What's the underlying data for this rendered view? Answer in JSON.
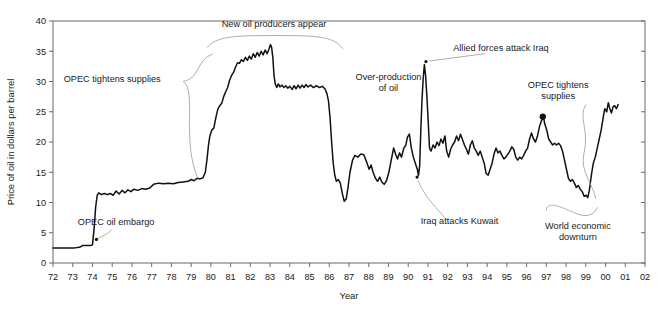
{
  "chart_data": {
    "type": "line",
    "title": "",
    "xlabel": "Year",
    "ylabel": "Price of oil in dollars per barrel",
    "xlim": [
      1972,
      2002
    ],
    "ylim": [
      0,
      40
    ],
    "grid": false,
    "legend": "none",
    "x_tick_labels": [
      "72",
      "73",
      "74",
      "75",
      "76",
      "77",
      "78",
      "79",
      "80",
      "81",
      "82",
      "83",
      "84",
      "85",
      "86",
      "87",
      "88",
      "89",
      "90",
      "91",
      "92",
      "93",
      "94",
      "95",
      "96",
      "97",
      "98",
      "99",
      "00",
      "01",
      "02"
    ],
    "y_tick_labels": [
      "0",
      "5",
      "10",
      "15",
      "20",
      "25",
      "30",
      "35",
      "40"
    ],
    "y_ticks": [
      0,
      5,
      10,
      15,
      20,
      25,
      30,
      35,
      40
    ],
    "series": [
      {
        "name": "Price of oil",
        "color": "#111111",
        "points": [
          [
            1972.0,
            2.5
          ],
          [
            1972.3,
            2.5
          ],
          [
            1972.6,
            2.5
          ],
          [
            1972.9,
            2.5
          ],
          [
            1973.1,
            2.5
          ],
          [
            1973.35,
            2.6
          ],
          [
            1973.5,
            2.9
          ],
          [
            1973.7,
            2.9
          ],
          [
            1973.9,
            2.9
          ],
          [
            1974.0,
            3.0
          ],
          [
            1974.08,
            5.6
          ],
          [
            1974.16,
            9.2
          ],
          [
            1974.24,
            11.2
          ],
          [
            1974.32,
            11.6
          ],
          [
            1974.45,
            11.3
          ],
          [
            1974.6,
            11.5
          ],
          [
            1974.75,
            11.3
          ],
          [
            1974.9,
            11.5
          ],
          [
            1975.05,
            11.2
          ],
          [
            1975.2,
            11.9
          ],
          [
            1975.35,
            11.4
          ],
          [
            1975.5,
            12.0
          ],
          [
            1975.65,
            11.6
          ],
          [
            1975.8,
            12.1
          ],
          [
            1975.95,
            11.8
          ],
          [
            1976.1,
            12.2
          ],
          [
            1976.3,
            12.0
          ],
          [
            1976.5,
            12.3
          ],
          [
            1976.7,
            12.2
          ],
          [
            1976.9,
            12.4
          ],
          [
            1977.1,
            13.0
          ],
          [
            1977.35,
            13.2
          ],
          [
            1977.6,
            13.1
          ],
          [
            1977.85,
            13.2
          ],
          [
            1978.1,
            13.1
          ],
          [
            1978.35,
            13.3
          ],
          [
            1978.6,
            13.4
          ],
          [
            1978.85,
            13.5
          ],
          [
            1979.0,
            13.8
          ],
          [
            1979.15,
            13.6
          ],
          [
            1979.3,
            14.0
          ],
          [
            1979.45,
            13.9
          ],
          [
            1979.6,
            14.1
          ],
          [
            1979.72,
            15.0
          ],
          [
            1979.8,
            17.0
          ],
          [
            1979.88,
            19.5
          ],
          [
            1979.95,
            21.0
          ],
          [
            1980.05,
            22.0
          ],
          [
            1980.15,
            22.3
          ],
          [
            1980.25,
            24.0
          ],
          [
            1980.35,
            25.4
          ],
          [
            1980.45,
            26.0
          ],
          [
            1980.55,
            26.4
          ],
          [
            1980.65,
            27.5
          ],
          [
            1980.75,
            28.3
          ],
          [
            1980.85,
            29.0
          ],
          [
            1980.95,
            30.2
          ],
          [
            1981.05,
            31.0
          ],
          [
            1981.15,
            31.5
          ],
          [
            1981.25,
            32.4
          ],
          [
            1981.35,
            33.1
          ],
          [
            1981.45,
            33.0
          ],
          [
            1981.55,
            33.6
          ],
          [
            1981.65,
            33.3
          ],
          [
            1981.75,
            34.0
          ],
          [
            1981.85,
            33.5
          ],
          [
            1981.95,
            34.2
          ],
          [
            1982.05,
            33.7
          ],
          [
            1982.15,
            34.6
          ],
          [
            1982.25,
            34.0
          ],
          [
            1982.35,
            34.8
          ],
          [
            1982.45,
            34.2
          ],
          [
            1982.55,
            35.0
          ],
          [
            1982.65,
            34.4
          ],
          [
            1982.75,
            35.2
          ],
          [
            1982.85,
            34.6
          ],
          [
            1982.95,
            35.4
          ],
          [
            1983.02,
            36.1
          ],
          [
            1983.08,
            35.6
          ],
          [
            1983.14,
            34.0
          ],
          [
            1983.2,
            31.0
          ],
          [
            1983.26,
            29.6
          ],
          [
            1983.34,
            29.0
          ],
          [
            1983.42,
            29.6
          ],
          [
            1983.5,
            29.1
          ],
          [
            1983.6,
            29.4
          ],
          [
            1983.7,
            29.0
          ],
          [
            1983.8,
            29.3
          ],
          [
            1983.9,
            28.9
          ],
          [
            1984.0,
            29.2
          ],
          [
            1984.12,
            28.7
          ],
          [
            1984.22,
            29.3
          ],
          [
            1984.32,
            28.8
          ],
          [
            1984.42,
            29.4
          ],
          [
            1984.52,
            28.9
          ],
          [
            1984.62,
            29.4
          ],
          [
            1984.72,
            29.0
          ],
          [
            1984.82,
            29.5
          ],
          [
            1984.92,
            29.1
          ],
          [
            1985.05,
            29.4
          ],
          [
            1985.2,
            29.0
          ],
          [
            1985.35,
            29.3
          ],
          [
            1985.5,
            29.0
          ],
          [
            1985.65,
            29.2
          ],
          [
            1985.78,
            28.8
          ],
          [
            1985.88,
            28.0
          ],
          [
            1985.96,
            26.8
          ],
          [
            1986.04,
            24.0
          ],
          [
            1986.12,
            20.0
          ],
          [
            1986.2,
            16.5
          ],
          [
            1986.28,
            14.5
          ],
          [
            1986.36,
            13.5
          ],
          [
            1986.46,
            13.8
          ],
          [
            1986.56,
            13.2
          ],
          [
            1986.66,
            11.5
          ],
          [
            1986.76,
            10.2
          ],
          [
            1986.86,
            10.6
          ],
          [
            1986.95,
            12.5
          ],
          [
            1987.05,
            15.0
          ],
          [
            1987.18,
            17.0
          ],
          [
            1987.3,
            17.8
          ],
          [
            1987.45,
            17.5
          ],
          [
            1987.6,
            18.0
          ],
          [
            1987.75,
            17.9
          ],
          [
            1987.88,
            16.8
          ],
          [
            1988.02,
            15.5
          ],
          [
            1988.12,
            16.2
          ],
          [
            1988.22,
            15.0
          ],
          [
            1988.34,
            14.0
          ],
          [
            1988.45,
            13.5
          ],
          [
            1988.56,
            14.2
          ],
          [
            1988.66,
            13.4
          ],
          [
            1988.78,
            13.0
          ],
          [
            1988.9,
            13.6
          ],
          [
            1989.02,
            15.0
          ],
          [
            1989.14,
            17.0
          ],
          [
            1989.26,
            19.0
          ],
          [
            1989.36,
            18.0
          ],
          [
            1989.46,
            17.2
          ],
          [
            1989.56,
            18.2
          ],
          [
            1989.66,
            17.5
          ],
          [
            1989.78,
            19.0
          ],
          [
            1989.88,
            19.5
          ],
          [
            1989.96,
            20.8
          ],
          [
            1990.06,
            21.3
          ],
          [
            1990.16,
            19.0
          ],
          [
            1990.26,
            17.5
          ],
          [
            1990.36,
            16.5
          ],
          [
            1990.46,
            15.5
          ],
          [
            1990.52,
            14.5
          ],
          [
            1990.58,
            16.0
          ],
          [
            1990.64,
            22.0
          ],
          [
            1990.7,
            27.0
          ],
          [
            1990.76,
            30.5
          ],
          [
            1990.82,
            32.8
          ],
          [
            1990.88,
            31.0
          ],
          [
            1990.94,
            28.0
          ],
          [
            1991.02,
            23.0
          ],
          [
            1991.08,
            19.0
          ],
          [
            1991.16,
            18.5
          ],
          [
            1991.26,
            19.5
          ],
          [
            1991.36,
            19.0
          ],
          [
            1991.46,
            20.0
          ],
          [
            1991.56,
            19.4
          ],
          [
            1991.66,
            20.5
          ],
          [
            1991.76,
            19.8
          ],
          [
            1991.86,
            21.0
          ],
          [
            1991.95,
            18.5
          ],
          [
            1992.05,
            17.5
          ],
          [
            1992.15,
            18.8
          ],
          [
            1992.25,
            19.5
          ],
          [
            1992.35,
            20.0
          ],
          [
            1992.45,
            21.0
          ],
          [
            1992.55,
            20.2
          ],
          [
            1992.65,
            21.3
          ],
          [
            1992.75,
            20.4
          ],
          [
            1992.85,
            19.5
          ],
          [
            1992.95,
            18.8
          ],
          [
            1993.05,
            18.0
          ],
          [
            1993.15,
            19.5
          ],
          [
            1993.25,
            20.2
          ],
          [
            1993.35,
            19.0
          ],
          [
            1993.45,
            18.5
          ],
          [
            1993.55,
            17.8
          ],
          [
            1993.65,
            18.5
          ],
          [
            1993.75,
            17.5
          ],
          [
            1993.85,
            16.5
          ],
          [
            1993.95,
            14.8
          ],
          [
            1994.05,
            14.5
          ],
          [
            1994.15,
            15.5
          ],
          [
            1994.25,
            16.5
          ],
          [
            1994.35,
            18.0
          ],
          [
            1994.45,
            19.0
          ],
          [
            1994.55,
            18.2
          ],
          [
            1994.65,
            18.5
          ],
          [
            1994.75,
            17.8
          ],
          [
            1994.85,
            17.2
          ],
          [
            1994.95,
            17.5
          ],
          [
            1995.05,
            18.0
          ],
          [
            1995.15,
            18.5
          ],
          [
            1995.25,
            19.2
          ],
          [
            1995.35,
            18.8
          ],
          [
            1995.45,
            17.5
          ],
          [
            1995.55,
            17.0
          ],
          [
            1995.65,
            17.5
          ],
          [
            1995.75,
            17.2
          ],
          [
            1995.85,
            17.8
          ],
          [
            1995.95,
            18.5
          ],
          [
            1996.05,
            19.0
          ],
          [
            1996.15,
            20.5
          ],
          [
            1996.25,
            21.5
          ],
          [
            1996.35,
            20.5
          ],
          [
            1996.45,
            20.0
          ],
          [
            1996.55,
            21.0
          ],
          [
            1996.65,
            22.5
          ],
          [
            1996.75,
            23.5
          ],
          [
            1996.85,
            24.2
          ],
          [
            1996.92,
            23.0
          ],
          [
            1997.02,
            22.0
          ],
          [
            1997.12,
            20.5
          ],
          [
            1997.22,
            20.0
          ],
          [
            1997.32,
            19.5
          ],
          [
            1997.42,
            19.8
          ],
          [
            1997.52,
            19.5
          ],
          [
            1997.62,
            19.8
          ],
          [
            1997.72,
            19.4
          ],
          [
            1997.82,
            18.5
          ],
          [
            1997.92,
            17.0
          ],
          [
            1998.02,
            15.5
          ],
          [
            1998.12,
            14.0
          ],
          [
            1998.22,
            13.5
          ],
          [
            1998.32,
            13.8
          ],
          [
            1998.42,
            13.2
          ],
          [
            1998.52,
            12.5
          ],
          [
            1998.62,
            12.8
          ],
          [
            1998.72,
            12.2
          ],
          [
            1998.82,
            11.8
          ],
          [
            1998.92,
            11.0
          ],
          [
            1999.02,
            11.2
          ],
          [
            1999.1,
            10.8
          ],
          [
            1999.18,
            12.0
          ],
          [
            1999.28,
            14.5
          ],
          [
            1999.38,
            16.5
          ],
          [
            1999.48,
            17.5
          ],
          [
            1999.58,
            19.0
          ],
          [
            1999.68,
            20.5
          ],
          [
            1999.78,
            22.0
          ],
          [
            1999.88,
            24.0
          ],
          [
            1999.96,
            25.5
          ],
          [
            2000.06,
            25.0
          ],
          [
            2000.14,
            26.5
          ],
          [
            2000.22,
            25.5
          ],
          [
            2000.3,
            24.8
          ],
          [
            2000.38,
            25.8
          ],
          [
            2000.46,
            26.0
          ],
          [
            2000.55,
            25.5
          ],
          [
            2000.64,
            26.2
          ]
        ]
      }
    ],
    "annotations": [
      {
        "id": "opec-tightens-supplies-1",
        "text": "OPEC tightens supplies",
        "x": 1975.0,
        "y": 30.0
      },
      {
        "id": "opec-oil-embargo",
        "text": "OPEC oil embargo",
        "x": 1975.2,
        "y": 6.3
      },
      {
        "id": "new-oil-producers-appear",
        "text": "New oil producers appear",
        "x": 1983.2,
        "y": 39.0
      },
      {
        "id": "over-production-of-oil",
        "text": "Over-production of oil",
        "line1": "Over-production",
        "line2": "of oil",
        "x": 1989.0,
        "y": 30.3
      },
      {
        "id": "allied-forces-attack-iraq",
        "text": "Allied forces attack Iraq",
        "x": 1994.7,
        "y": 35.0
      },
      {
        "id": "iraq-attacks-kuwait",
        "text": "Iraq attacks Kuwait",
        "x": 1992.6,
        "y": 6.4
      },
      {
        "id": "opec-tightens-supplies-2",
        "text": "OPEC tightens supplies",
        "line1": "OPEC tightens",
        "line2": "supplies",
        "x": 1997.6,
        "y": 29.0
      },
      {
        "id": "world-economic-downturn",
        "text": "World economic downturn",
        "line1": "World economic",
        "line2": "downturn",
        "x": 1998.6,
        "y": 5.7
      }
    ],
    "markers": [
      {
        "id": "marker-opec-tightens-supplies-2",
        "x": 1996.82,
        "y": 24.2,
        "style": "filled-dot"
      }
    ]
  }
}
